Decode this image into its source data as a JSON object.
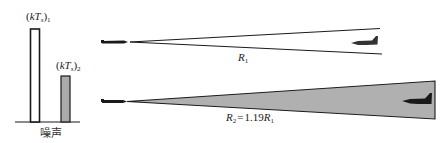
{
  "figure": {
    "noise_panel": {
      "bars": [
        {
          "label_main": "kT",
          "label_sub_s": "s",
          "label_index": "1",
          "fill": "#ffffff",
          "relative_height": 1.0
        },
        {
          "label_main": "kT",
          "label_sub_s": "s",
          "label_index": "2",
          "fill": "#aaaaaa",
          "relative_height": 0.49
        }
      ],
      "axis_label": "噪声"
    },
    "range_top": {
      "label_var": "R",
      "label_index": "1",
      "beam_fill": "#ffffff"
    },
    "range_bottom": {
      "label_var_left": "R",
      "label_index_left": "2",
      "equals": "=",
      "coefficient": "1.19",
      "label_var_right": "R",
      "label_index_right": "1",
      "beam_fill": "#b0b0b0"
    },
    "colors": {
      "ink": "#1a1a1a",
      "gray_fill": "#aaaaaa"
    }
  }
}
